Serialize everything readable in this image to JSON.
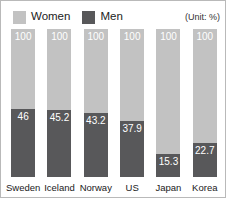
{
  "legend": {
    "entries": [
      {
        "label": "Women",
        "color": "#c2c2c2",
        "icon": "legend-swatch-women"
      },
      {
        "label": "Men",
        "color": "#58585a",
        "icon": "legend-swatch-men"
      }
    ]
  },
  "unit_note": "(Unit: %)",
  "chart_data": {
    "type": "bar",
    "title": "",
    "subtitle": "",
    "xlabel": "",
    "ylabel": "",
    "ylim": [
      0,
      100
    ],
    "grid": false,
    "legend_position": "top-left",
    "unit": "%",
    "annotations": [
      "(Unit: %)"
    ],
    "categories": [
      "Sweden",
      "Iceland",
      "Norway",
      "US",
      "Japan",
      "Korea"
    ],
    "series": [
      {
        "name": "Women",
        "color": "#c2c2c2",
        "values": [
          100,
          100,
          100,
          100,
          100,
          100
        ],
        "labels": [
          "100",
          "100",
          "100",
          "100",
          "100",
          "100"
        ]
      },
      {
        "name": "Men",
        "color": "#58585a",
        "values": [
          46,
          45.2,
          43.2,
          37.9,
          15.3,
          22.7
        ],
        "labels": [
          "46",
          "45.2",
          "43.2",
          "37.9",
          "15.3",
          "22.7"
        ]
      }
    ]
  }
}
